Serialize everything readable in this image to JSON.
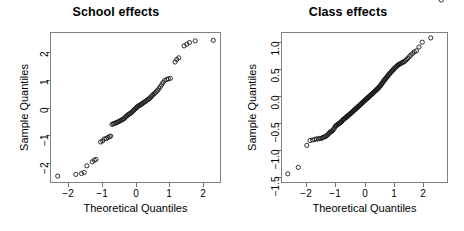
{
  "figure": {
    "width": 464,
    "height": 231,
    "background": "#ffffff",
    "marker_color": "#1a1a1a",
    "axis_color": "#6e6e6e"
  },
  "chart_data": [
    {
      "type": "scatter",
      "name": "school-effects-qq",
      "title": "School effects",
      "xlabel": "Theoretical Quantiles",
      "ylabel": "Sample Quantiles",
      "xlim": [
        -2.55,
        2.55
      ],
      "ylim": [
        -2.72,
        2.72
      ],
      "xticks": [
        -2,
        -1,
        0,
        1,
        2
      ],
      "xticklabels": [
        "−2",
        "−1",
        "0",
        "1",
        "2"
      ],
      "yticks": [
        -2,
        -1,
        0,
        1,
        2
      ],
      "yticklabels": [
        "−2",
        "−1",
        "0",
        "1",
        "2"
      ],
      "grid": false,
      "legend": "none",
      "marker": "open-circle",
      "x": [
        -2.32,
        -1.78,
        -1.61,
        -1.53,
        -1.45,
        -1.29,
        -1.23,
        -1.18,
        -1.04,
        -0.98,
        -0.93,
        -0.87,
        -0.82,
        -0.78,
        -0.74,
        -0.7,
        -0.66,
        -0.63,
        -0.59,
        -0.56,
        -0.52,
        -0.49,
        -0.46,
        -0.43,
        -0.4,
        -0.37,
        -0.34,
        -0.31,
        -0.28,
        -0.25,
        -0.22,
        -0.19,
        -0.17,
        -0.14,
        -0.11,
        -0.08,
        -0.05,
        -0.03,
        0.0,
        0.03,
        0.05,
        0.08,
        0.11,
        0.14,
        0.17,
        0.19,
        0.22,
        0.25,
        0.28,
        0.31,
        0.34,
        0.37,
        0.4,
        0.43,
        0.46,
        0.49,
        0.52,
        0.56,
        0.59,
        0.63,
        0.66,
        0.7,
        0.74,
        0.78,
        0.82,
        0.87,
        0.93,
        0.98,
        1.04,
        1.18,
        1.23,
        1.29,
        1.45,
        1.53,
        1.61,
        1.78,
        2.32
      ],
      "y": [
        -2.47,
        -2.41,
        -2.38,
        -2.34,
        -2.1,
        -1.96,
        -1.9,
        -1.87,
        -1.24,
        -1.2,
        -1.13,
        -1.12,
        -1.08,
        -1.05,
        -1.03,
        -0.61,
        -0.59,
        -0.57,
        -0.56,
        -0.54,
        -0.52,
        -0.5,
        -0.48,
        -0.46,
        -0.44,
        -0.42,
        -0.4,
        -0.36,
        -0.32,
        -0.29,
        -0.26,
        -0.24,
        -0.22,
        -0.2,
        -0.17,
        -0.13,
        -0.1,
        -0.07,
        -0.04,
        -0.01,
        0.02,
        0.05,
        0.07,
        0.09,
        0.11,
        0.13,
        0.16,
        0.18,
        0.21,
        0.23,
        0.26,
        0.29,
        0.31,
        0.34,
        0.38,
        0.42,
        0.46,
        0.5,
        0.54,
        0.58,
        0.62,
        0.68,
        0.75,
        0.82,
        0.9,
        0.97,
        1.01,
        1.03,
        1.05,
        1.64,
        1.73,
        1.79,
        2.22,
        2.28,
        2.34,
        2.4,
        2.42
      ]
    },
    {
      "type": "scatter",
      "name": "class-effects-qq",
      "title": "Class effects",
      "xlabel": "Theoretical Quantiles",
      "ylabel": "Sample Quantiles",
      "xlim": [
        -2.85,
        2.85
      ],
      "ylim": [
        -1.62,
        1.19
      ],
      "xticks": [
        -2,
        -1,
        0,
        1,
        2
      ],
      "xticklabels": [
        "−2",
        "−1",
        "0",
        "1",
        "2"
      ],
      "yticks": [
        -1.5,
        -1.0,
        -0.5,
        0.0,
        0.5,
        1.0
      ],
      "yticklabels": [
        "−1.5",
        "−1.0",
        "−0.5",
        "0.0",
        "0.5",
        "1.0"
      ],
      "grid": false,
      "legend": "none",
      "marker": "open-circle",
      "x": [
        -2.62,
        -2.26,
        -1.97,
        -1.86,
        -1.77,
        -1.7,
        -1.64,
        -1.58,
        -1.53,
        -1.48,
        -1.44,
        -1.4,
        -1.36,
        -1.32,
        -1.29,
        -1.25,
        -1.22,
        -1.19,
        -1.16,
        -1.13,
        -1.1,
        -1.07,
        -1.04,
        -1.01,
        -0.99,
        -0.96,
        -0.94,
        -0.91,
        -0.89,
        -0.86,
        -0.84,
        -0.81,
        -0.79,
        -0.77,
        -0.74,
        -0.72,
        -0.7,
        -0.68,
        -0.65,
        -0.63,
        -0.61,
        -0.59,
        -0.57,
        -0.55,
        -0.53,
        -0.5,
        -0.48,
        -0.46,
        -0.44,
        -0.42,
        -0.4,
        -0.38,
        -0.36,
        -0.34,
        -0.32,
        -0.3,
        -0.28,
        -0.26,
        -0.24,
        -0.22,
        -0.2,
        -0.18,
        -0.16,
        -0.14,
        -0.12,
        -0.1,
        -0.08,
        -0.06,
        -0.04,
        -0.02,
        0.0,
        0.02,
        0.04,
        0.06,
        0.08,
        0.1,
        0.12,
        0.14,
        0.16,
        0.18,
        0.2,
        0.22,
        0.24,
        0.26,
        0.28,
        0.3,
        0.32,
        0.34,
        0.36,
        0.38,
        0.4,
        0.42,
        0.44,
        0.46,
        0.48,
        0.5,
        0.53,
        0.55,
        0.57,
        0.59,
        0.61,
        0.63,
        0.65,
        0.68,
        0.7,
        0.72,
        0.74,
        0.77,
        0.79,
        0.81,
        0.84,
        0.86,
        0.89,
        0.91,
        0.94,
        0.96,
        0.99,
        1.01,
        1.04,
        1.07,
        1.1,
        1.13,
        1.16,
        1.19,
        1.22,
        1.25,
        1.29,
        1.32,
        1.36,
        1.4,
        1.44,
        1.48,
        1.53,
        1.58,
        1.64,
        1.7,
        1.77,
        1.86,
        1.97,
        2.26,
        2.62
      ],
      "y": [
        -1.45,
        -1.33,
        -0.92,
        -0.83,
        -0.82,
        -0.81,
        -0.8,
        -0.8,
        -0.79,
        -0.79,
        -0.78,
        -0.77,
        -0.76,
        -0.75,
        -0.74,
        -0.72,
        -0.7,
        -0.68,
        -0.67,
        -0.66,
        -0.65,
        -0.63,
        -0.61,
        -0.58,
        -0.56,
        -0.55,
        -0.54,
        -0.53,
        -0.52,
        -0.51,
        -0.5,
        -0.49,
        -0.48,
        -0.46,
        -0.45,
        -0.44,
        -0.43,
        -0.42,
        -0.41,
        -0.4,
        -0.39,
        -0.38,
        -0.37,
        -0.36,
        -0.35,
        -0.34,
        -0.33,
        -0.32,
        -0.31,
        -0.3,
        -0.29,
        -0.28,
        -0.27,
        -0.26,
        -0.25,
        -0.24,
        -0.23,
        -0.22,
        -0.21,
        -0.2,
        -0.19,
        -0.18,
        -0.17,
        -0.16,
        -0.15,
        -0.14,
        -0.13,
        -0.12,
        -0.11,
        -0.1,
        -0.09,
        -0.08,
        -0.07,
        -0.06,
        -0.05,
        -0.04,
        -0.03,
        -0.02,
        -0.01,
        0.0,
        0.01,
        0.02,
        0.03,
        0.04,
        0.05,
        0.06,
        0.07,
        0.08,
        0.09,
        0.1,
        0.11,
        0.12,
        0.13,
        0.14,
        0.15,
        0.17,
        0.18,
        0.2,
        0.21,
        0.23,
        0.24,
        0.26,
        0.28,
        0.29,
        0.31,
        0.32,
        0.34,
        0.35,
        0.37,
        0.39,
        0.4,
        0.42,
        0.43,
        0.45,
        0.46,
        0.48,
        0.49,
        0.51,
        0.52,
        0.54,
        0.55,
        0.57,
        0.58,
        0.59,
        0.6,
        0.61,
        0.62,
        0.63,
        0.64,
        0.66,
        0.68,
        0.7,
        0.73,
        0.76,
        0.79,
        0.82,
        0.84,
        0.91,
        1.0,
        1.08
      ]
    }
  ]
}
